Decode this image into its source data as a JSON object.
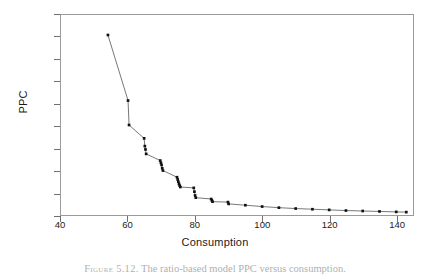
{
  "figure": {
    "caption_lead": "Figure 5.12.",
    "caption_text": "The ratio-based model PPC versus consumption."
  },
  "axes": {
    "y_title": "PPC",
    "x_title": "Consumption",
    "y_ticks": [
      "0.00",
      "1.00",
      "2.00",
      "3.00",
      "4.00",
      "5.00",
      "6.00",
      "7.00",
      "8.00",
      "9.00"
    ],
    "x_ticks": [
      "40",
      "60",
      "80",
      "100",
      "120",
      "140"
    ]
  },
  "chart_data": {
    "type": "scatter",
    "title": "",
    "xlabel": "Consumption",
    "ylabel": "PPC",
    "xlim": [
      40,
      145
    ],
    "ylim": [
      0.0,
      9.0
    ],
    "xticks": [
      40,
      60,
      80,
      100,
      120,
      140
    ],
    "yticks": [
      0.0,
      1.0,
      2.0,
      3.0,
      4.0,
      5.0,
      6.0,
      7.0,
      8.0,
      9.0
    ],
    "grid": false,
    "legend": false,
    "marker": "square",
    "marker_color": "#111111",
    "line_color": "#555555",
    "series": [
      {
        "name": "PPC",
        "x": [
          54.0,
          60.0,
          60.3,
          64.8,
          65.0,
          65.2,
          65.4,
          69.6,
          69.8,
          70.0,
          70.2,
          70.4,
          74.6,
          74.8,
          75.0,
          75.2,
          75.4,
          75.6,
          79.6,
          79.8,
          80.0,
          80.2,
          84.8,
          85.0,
          85.2,
          89.8,
          90.0,
          95.0,
          100.0,
          105.0,
          110.0,
          115.0,
          120.0,
          125.0,
          130.0,
          135.0,
          140.0,
          143.0
        ],
        "y": [
          8.1,
          5.15,
          4.05,
          3.45,
          3.1,
          2.95,
          2.75,
          2.45,
          2.35,
          2.25,
          2.1,
          2.0,
          1.7,
          1.6,
          1.5,
          1.4,
          1.32,
          1.26,
          1.22,
          1.05,
          0.88,
          0.78,
          0.72,
          0.66,
          0.6,
          0.58,
          0.5,
          0.44,
          0.38,
          0.33,
          0.29,
          0.26,
          0.23,
          0.2,
          0.18,
          0.16,
          0.14,
          0.13
        ]
      }
    ]
  }
}
